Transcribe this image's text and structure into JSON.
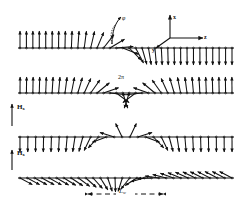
{
  "figure": {
    "type": "magnetic-domain-wall-spin-diagram",
    "background_color": "#ffffff",
    "ink_color": "#111111"
  },
  "axes_inset": {
    "name": "coordinate-axes",
    "origin_px": [
      170,
      38
    ],
    "labels": {
      "x": "x",
      "z": "z",
      "y": "y"
    },
    "directions": {
      "x": "up",
      "z": "right",
      "y": "down-left-diagonal"
    }
  },
  "annotations": {
    "phi_label": "φ",
    "two_pi_label": "2π",
    "wall_width_label": "L",
    "wall_width_sub": "w",
    "field_label": "H",
    "field_sub": "x"
  },
  "rows": [
    {
      "id": "row-1",
      "name": "spin-row-180-wall",
      "baseline_y": 48,
      "x_start": 20,
      "x_end": 232,
      "n_spins": 34,
      "left_state_deg": 90,
      "right_state_deg": -90,
      "wall_center_frac": 0.46,
      "wall_width_frac": 0.2,
      "turns": 1,
      "has_field_label": false,
      "arrow_len": 17
    },
    {
      "id": "row-2",
      "name": "spin-row-360-wall",
      "baseline_y": 93,
      "x_start": 20,
      "x_end": 232,
      "n_spins": 34,
      "left_state_deg": 90,
      "right_state_deg": 90,
      "wall_center_frac": 0.5,
      "wall_width_frac": 0.3,
      "turns": 2,
      "has_field_label": false,
      "arrow_len": 16
    },
    {
      "id": "row-3",
      "name": "spin-row-field-Hx-weak",
      "baseline_y": 137,
      "x_start": 20,
      "x_end": 232,
      "n_spins": 28,
      "left_state_deg": -90,
      "right_state_deg": -90,
      "wall_center_frac": 0.5,
      "wall_width_frac": 0.26,
      "turns": 2,
      "has_field_label": true,
      "field_arrow_y_top": 104,
      "field_arrow_y_bot": 126,
      "field_arrow_x": 12,
      "arrow_len": 15
    },
    {
      "id": "row-4",
      "name": "spin-row-field-Hx-strong",
      "baseline_y": 178,
      "x_start": 20,
      "x_end": 232,
      "n_spins": 30,
      "left_state_deg": -28,
      "right_state_deg": -28,
      "wall_center_frac": 0.5,
      "wall_width_frac": 0.3,
      "turns": 1,
      "has_field_label": true,
      "field_arrow_y_top": 150,
      "field_arrow_y_bot": 170,
      "field_arrow_x": 12,
      "arrow_len": 14
    }
  ],
  "dimension_line": {
    "name": "wall-width-dimension",
    "y": 194,
    "x_left": 88,
    "x_right": 163,
    "style": "dashed-with-arrowheads",
    "label": "L",
    "label_sub": "w"
  },
  "phi_marker": {
    "name": "phi-angle-marker",
    "arc_center": [
      112,
      44
    ],
    "label_pos": [
      123,
      19
    ]
  },
  "chart_data": {
    "type": "line",
    "title": "",
    "xlabel": "z",
    "ylabel": "spin angle φ",
    "series": [
      {
        "name": "180° wall (row 1)",
        "turns": 1,
        "left_deg": 90,
        "right_deg": -90
      },
      {
        "name": "360° wall (row 2)",
        "turns": 2,
        "left_deg": 90,
        "right_deg": 90
      },
      {
        "name": "wall in field H_x (row 3)",
        "turns": 2,
        "left_deg": -90,
        "right_deg": -90
      },
      {
        "name": "canted wall in H_x (row 4)",
        "turns": 1,
        "left_deg": -28,
        "right_deg": -28
      }
    ]
  }
}
